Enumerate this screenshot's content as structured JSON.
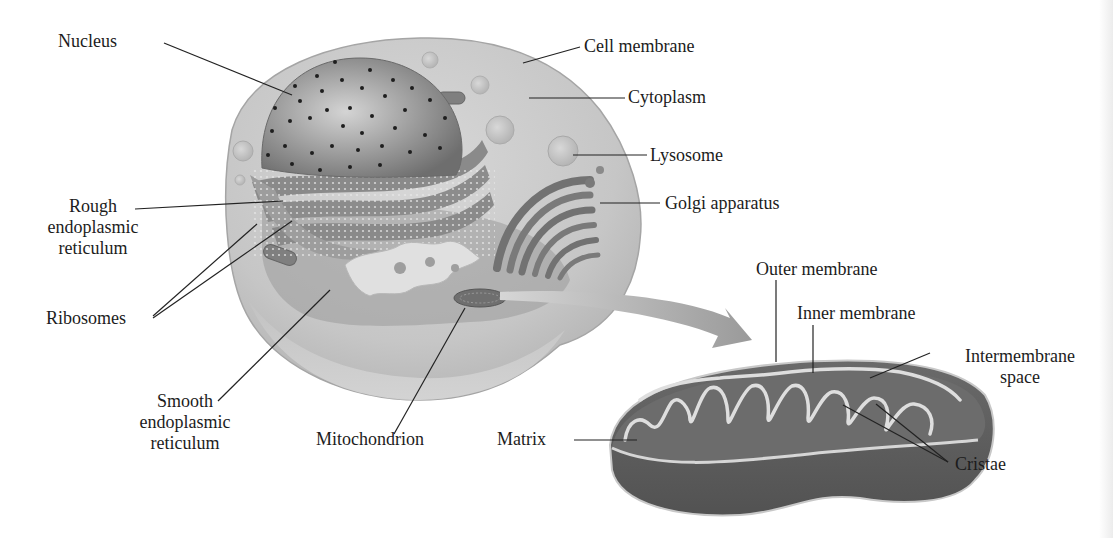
{
  "figure": {
    "cell_labels": {
      "nucleus": "Nucleus",
      "cell_membrane": "Cell membrane",
      "cytoplasm": "Cytoplasm",
      "lysosome": "Lysosome",
      "golgi": "Golgi apparatus",
      "rough_er": [
        "Rough",
        "endoplasmic",
        "reticulum"
      ],
      "ribosomes": "Ribosomes",
      "smooth_er": [
        "Smooth",
        "endoplasmic",
        "reticulum"
      ],
      "mitochondrion": "Mitochondrion"
    },
    "mitochondrion_labels": {
      "outer_membrane": "Outer membrane",
      "inner_membrane": "Inner membrane",
      "intermembrane_space": [
        "Intermembrane",
        "space"
      ],
      "matrix": "Matrix",
      "cristae": "Cristae"
    },
    "colors": {
      "cell_fill": "#c9c9c9",
      "cell_edge": "#a9a9a9",
      "nucleus": "#8e8e8e",
      "organelle": "#7d7d7d",
      "mito_body": "#5d5d5d",
      "cristae_line": "#e2e2e2",
      "arrow": "#a8a8a8",
      "leader_line": "#222222"
    }
  }
}
